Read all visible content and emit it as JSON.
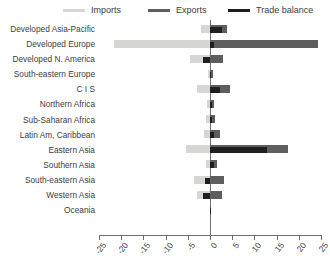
{
  "legend": {
    "items": [
      {
        "label": "Imports",
        "color": "#d6d6d4"
      },
      {
        "label": "Exports",
        "color": "#5e5e5e"
      },
      {
        "label": "Trade balance",
        "color": "#1f1f1f"
      }
    ]
  },
  "chart_data": {
    "type": "bar",
    "orientation": "horizontal",
    "title": "",
    "xlabel": "",
    "ylabel": "",
    "xlim": [
      -25,
      25
    ],
    "xticks": [
      -25,
      -20,
      -15,
      -10,
      -5,
      0,
      5,
      10,
      15,
      20,
      25
    ],
    "xticklabels": [
      "-25",
      "-20",
      "-15",
      "-10",
      "-5",
      "0",
      "5",
      "10",
      "15",
      "20",
      "25"
    ],
    "grid": false,
    "legend_position": "top",
    "categories": [
      "Developed Asia-Pacific",
      "Developed Europe",
      "Developed N. America",
      "South-eastern Europe",
      "C I S",
      "Northern Africa",
      "Sub-Saharan Africa",
      "Latin Am, Caribbean",
      "Eastern Asia",
      "Southern Asia",
      "South-eastern Asia",
      "Western Asia",
      "Oceania"
    ],
    "series": [
      {
        "name": "Imports",
        "color": "#d6d6d4",
        "values": [
          -2.0,
          -21.6,
          -4.5,
          -0.5,
          -3.0,
          -0.6,
          -0.8,
          -1.4,
          -5.4,
          -1.0,
          -3.5,
          -3.0,
          -0.1
        ]
      },
      {
        "name": "Exports",
        "color": "#5e5e5e",
        "values": [
          3.8,
          24.4,
          3.0,
          0.6,
          4.4,
          0.9,
          1.1,
          2.2,
          17.6,
          1.6,
          3.1,
          2.6,
          0.15
        ]
      },
      {
        "name": "Trade balance",
        "color": "#1f1f1f",
        "values": [
          2.8,
          0.9,
          -1.6,
          0.2,
          2.2,
          0.4,
          0.5,
          1.0,
          12.8,
          1.0,
          -1.2,
          -1.5,
          0.05
        ]
      }
    ]
  }
}
